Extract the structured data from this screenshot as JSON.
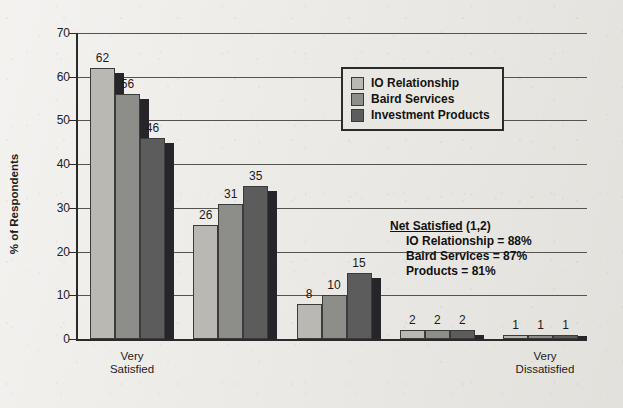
{
  "chart_data": {
    "type": "bar",
    "title": "",
    "xlabel": "",
    "ylabel": "% of Respondents",
    "ylim": [
      0,
      70
    ],
    "yticks": [
      0,
      10,
      20,
      30,
      40,
      50,
      60,
      70
    ],
    "grid": true,
    "legend_position": "top-center-right",
    "categories": [
      "1",
      "2",
      "3",
      "4",
      "5"
    ],
    "category_endpoint_labels": {
      "left": "Very\nSatisfied",
      "right": "Very\nDissatisfied"
    },
    "series": [
      {
        "name": "IO Relationship",
        "color": "#b9b8b3",
        "values": [
          62,
          26,
          8,
          2,
          1
        ]
      },
      {
        "name": "Baird Services",
        "color": "#8d8d89",
        "values": [
          56,
          31,
          10,
          2,
          1
        ]
      },
      {
        "name": "Investment Products",
        "color": "#5c5c5c",
        "values": [
          46,
          35,
          15,
          2,
          1
        ]
      }
    ],
    "annotations": {
      "net_satisfied": {
        "title_underlined": "Net Satisfied",
        "title_suffix": " (1,2)",
        "lines": [
          "IO Relationship = 88%",
          "Baird Services = 87%",
          "Products = 81%"
        ]
      }
    }
  }
}
